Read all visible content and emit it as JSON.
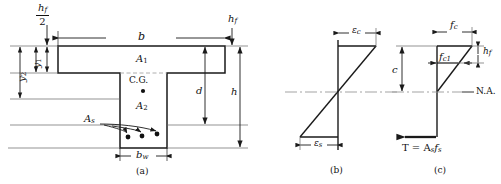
{
  "figure": {
    "captions": [
      {
        "id": "a",
        "text": "(a)",
        "describes": "cross section"
      },
      {
        "id": "b",
        "text": "(b)",
        "describes": "strain diagram"
      },
      {
        "id": "c",
        "text": "(c)",
        "describes": "stress diagram"
      }
    ],
    "colors": {
      "line": "#1a1a1a",
      "thin_line": "#555555",
      "centerline": "#888888",
      "background": "#ffffff",
      "text": "#111111"
    }
  },
  "section": {
    "name": "cross-section",
    "dimension_labels": {
      "flange_width": "b",
      "web_width": "b",
      "web_width_sub": "w",
      "flange_thickness": "h",
      "flange_thickness_sub": "f",
      "half_flange_num": "h",
      "half_flange_num_sub": "f",
      "half_flange_den": "2",
      "effective_depth": "d",
      "total_depth": "h",
      "y_outer": "y",
      "y_outer_sub": "2",
      "y_inner": "y",
      "y_inner_sub": "1"
    },
    "area_labels": {
      "flange_area": "A",
      "flange_area_sub": "1",
      "web_area": "A",
      "web_area_sub": "2",
      "steel_area": "A",
      "steel_area_sub": "s",
      "centroid": "C.G."
    },
    "rebar_count": 3
  },
  "strain_diagram": {
    "name": "strain-diagram",
    "labels": {
      "concrete_strain": "ε",
      "concrete_strain_sub": "c",
      "steel_strain": "ε",
      "steel_strain_sub": "s"
    }
  },
  "stress_diagram": {
    "name": "stress-diagram",
    "labels": {
      "concrete_stress": "f",
      "concrete_stress_sub": "c",
      "flange_bottom_stress": "f",
      "flange_bottom_stress_sub": "c1",
      "neutral_axis_depth": "c",
      "flange_thickness": "h",
      "flange_thickness_sub": "f",
      "neutral_axis": "N.A.",
      "tension_force": "T = A",
      "tension_force_sub1": "s",
      "tension_force_mid": "f",
      "tension_force_sub2": "s"
    }
  }
}
